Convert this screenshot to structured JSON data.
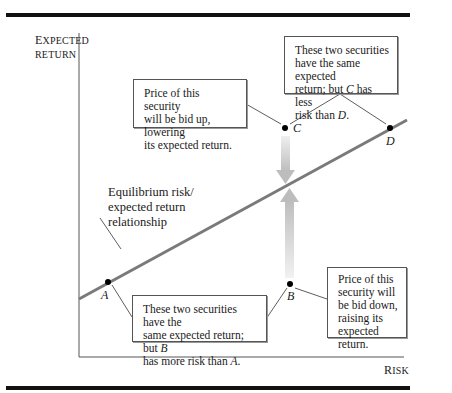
{
  "figure": {
    "y_axis_label_first": "E",
    "y_axis_label_rest": "XPECTED",
    "y_axis_label_line2": "RETURN",
    "x_axis_label_first": "R",
    "x_axis_label_rest": "ISK",
    "line_label": [
      "Equilibrium risk/",
      "expected return",
      "relationship"
    ],
    "points": [
      {
        "name": "A",
        "x": 108,
        "y": 282
      },
      {
        "name": "B",
        "x": 290,
        "y": 284
      },
      {
        "name": "C",
        "x": 285,
        "y": 128
      },
      {
        "name": "D",
        "x": 390,
        "y": 128
      }
    ],
    "notes": {
      "c_note": [
        "Price of this security",
        "will be bid up, lowering",
        "its expected return."
      ],
      "cd_note": {
        "l1": "These two securities",
        "l2": "have the same expected",
        "l3_pre": "return; but ",
        "l3_var": "C",
        "l3_post": " has less",
        "l4_pre": "risk than ",
        "l4_var": "D",
        "l4_post": "."
      },
      "ab_note": {
        "l1": "These two securities have the",
        "l2_pre": "same expected return; but ",
        "l2_var": "B",
        "l3_pre": "has more risk than ",
        "l3_var": "A",
        "l3_post": "."
      },
      "b_note": [
        "Price of this",
        "security will",
        "be bid down,",
        "raising its",
        "expected return."
      ]
    },
    "colors": {
      "line": "#7a7a7a",
      "arrow": "#c8c8c8",
      "rule": "#111111"
    }
  }
}
